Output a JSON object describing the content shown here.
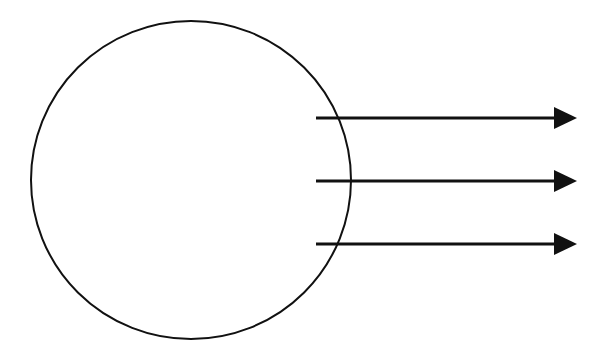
{
  "diagram": {
    "background": "#ffffff",
    "stroke_color": "#111111",
    "circle": {
      "cx": 191,
      "cy": 180,
      "rx": 160,
      "ry": 159,
      "stroke_width": 2
    },
    "arrows": [
      {
        "x1": 316,
        "y": 118,
        "x2": 554,
        "head_tip": 577,
        "head_half_height": 11
      },
      {
        "x1": 316,
        "y": 181,
        "x2": 554,
        "head_tip": 577,
        "head_half_height": 11
      },
      {
        "x1": 316,
        "y": 244,
        "x2": 554,
        "head_tip": 577,
        "head_half_height": 11
      }
    ]
  }
}
